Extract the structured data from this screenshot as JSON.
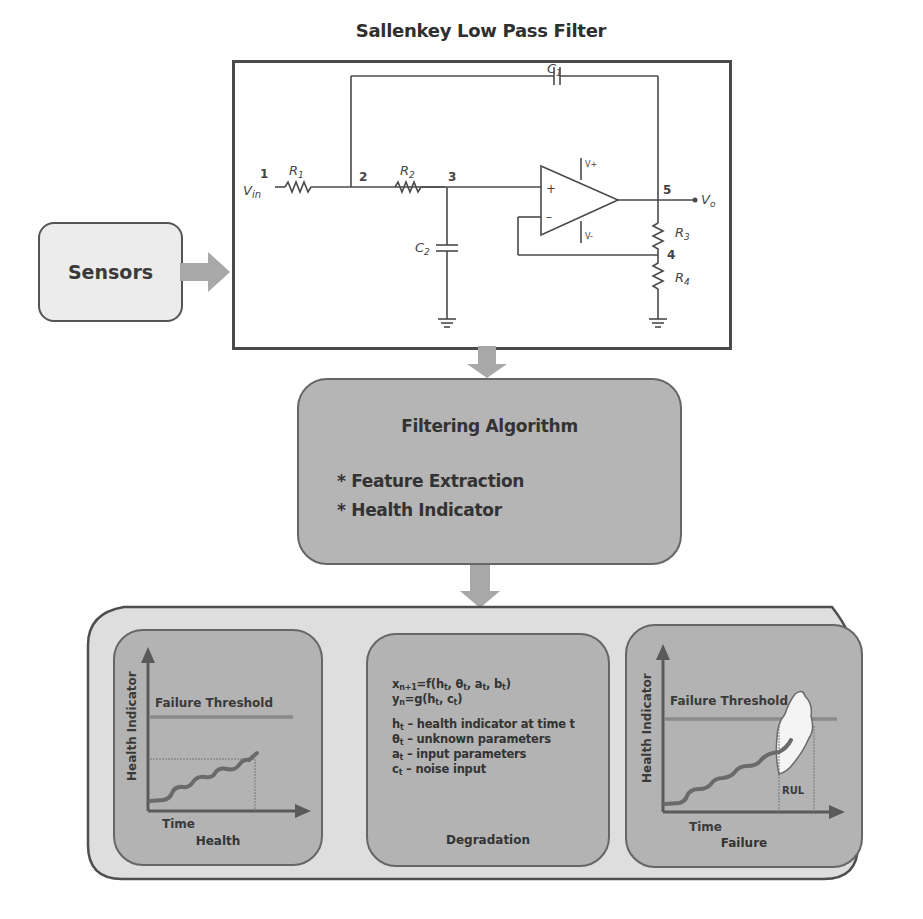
{
  "title": "Sallenkey Low Pass Filter",
  "circuit": {
    "labels": {
      "vin": "V",
      "vin_sub": "in",
      "vo": "V",
      "vo_sub": "o",
      "node1": "1",
      "node2": "2",
      "node3": "3",
      "node4": "4",
      "node5": "5",
      "r1": "R",
      "r1_sub": "1",
      "r2": "R",
      "r2_sub": "2",
      "r3": "R",
      "r3_sub": "3",
      "r4": "R",
      "r4_sub": "4",
      "c1": "C",
      "c1_sub": "1",
      "c2": "C",
      "c2_sub": "2",
      "plus": "+",
      "minus": "–",
      "vplus": "V+",
      "vminus": "V-"
    }
  },
  "sensors": {
    "label": "Sensors"
  },
  "filtering": {
    "title": "Filtering Algorithm",
    "items": [
      "* Feature Extraction",
      "* Health Indicator"
    ]
  },
  "panels": {
    "health": {
      "caption": "Health",
      "y_axis": "Health Indicator",
      "x_axis": "Time",
      "threshold": "Failure Threshold"
    },
    "degradation": {
      "caption": "Degradation",
      "eq1": {
        "lhs": "x",
        "lhs_sub": "n+1",
        "rhs": "=f(h",
        "a": "t",
        "b": ", θ",
        "c": "t",
        "d": ", a",
        "e": "t",
        "f": ", b",
        "g": "t",
        "h": ")"
      },
      "eq2": {
        "lhs": "y",
        "lhs_sub": "n",
        "rhs": "=g(h",
        "a": "t",
        "b": ", c",
        "c": "t",
        "d": ")"
      },
      "defs": [
        {
          "sym": "h",
          "sub": "t",
          "text": " – health indicator at time t"
        },
        {
          "sym": "θ",
          "sub": "t",
          "text": " – unknown parameters"
        },
        {
          "sym": "a",
          "sub": "t",
          "text": " – input parameters"
        },
        {
          "sym": "c",
          "sub": "t",
          "text": " – noise input"
        }
      ]
    },
    "failure": {
      "caption": "Failure",
      "y_axis": "Health Indicator",
      "x_axis": "Time",
      "threshold": "Failure Threshold",
      "rul": "RUL"
    }
  },
  "colors": {
    "box_border": "#4a4a4a",
    "arrow": "#a8a8a8",
    "panel_fill": "#b3b3b3",
    "outer_fill": "#dedede",
    "curve": "#6a6a6a",
    "threshold": "#8a8a8a"
  }
}
